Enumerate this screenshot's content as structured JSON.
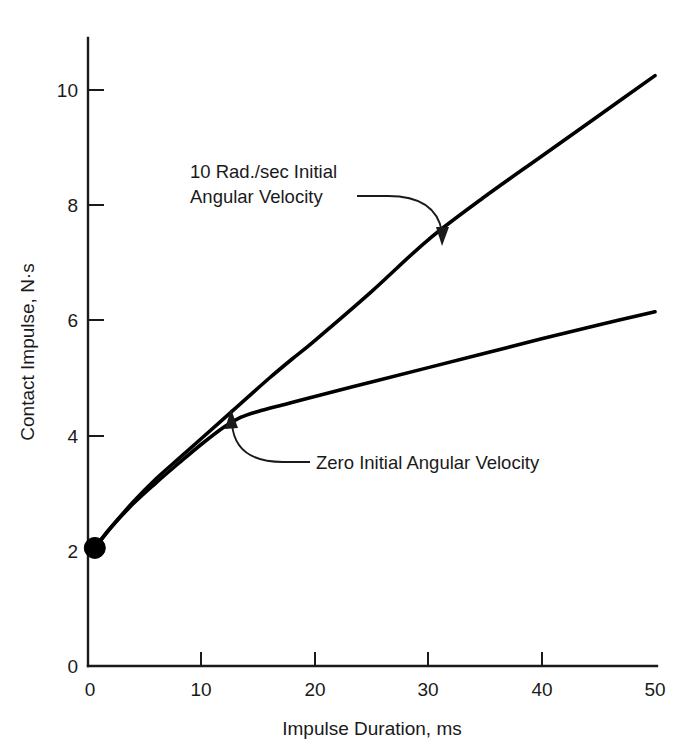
{
  "chart_data": {
    "type": "line",
    "title": "",
    "xlabel": "Impulse Duration, ms",
    "ylabel": "Contact Impulse, N·s",
    "xlim": [
      0,
      50
    ],
    "ylim": [
      0,
      10.6
    ],
    "xticks": [
      0,
      10,
      20,
      30,
      40,
      50
    ],
    "yticks": [
      0,
      2,
      4,
      6,
      8,
      10
    ],
    "xtick_labels": [
      "0",
      "10",
      "20",
      "30",
      "40",
      "50"
    ],
    "ytick_labels": [
      "0",
      "2",
      "4",
      "6",
      "8",
      "10"
    ],
    "grid": false,
    "legend_position": "none",
    "start_marker": {
      "x": 0.6,
      "y": 2.05,
      "style": "filled-circle"
    },
    "series": [
      {
        "name": "10 Rad./sec Initial Angular Velocity",
        "x": [
          0.6,
          2,
          4,
          6,
          8,
          10,
          12,
          14,
          16,
          18,
          20,
          25,
          30,
          35,
          40,
          45,
          50
        ],
        "y": [
          2.05,
          2.4,
          2.85,
          3.25,
          3.6,
          3.95,
          4.3,
          4.65,
          5.0,
          5.33,
          5.65,
          6.5,
          7.4,
          8.15,
          8.85,
          9.55,
          10.25
        ]
      },
      {
        "name": "Zero Initial Angular Velocity",
        "x": [
          0.6,
          2,
          4,
          6,
          8,
          10,
          12,
          13.5,
          15,
          17.5,
          20,
          25,
          30,
          35,
          40,
          45,
          50
        ],
        "y": [
          2.05,
          2.4,
          2.82,
          3.18,
          3.52,
          3.85,
          4.15,
          4.32,
          4.42,
          4.55,
          4.68,
          4.93,
          5.18,
          5.43,
          5.68,
          5.92,
          6.15
        ]
      }
    ],
    "annotations": [
      {
        "name": "upper-curve-annotation",
        "lines": [
          "10 Rad./sec Initial",
          "Angular Velocity"
        ],
        "text_x": 9.2,
        "text_y": 7.9,
        "points_to_x": 30.5,
        "points_to_y": 7.55
      },
      {
        "name": "lower-curve-annotation",
        "lines": [
          "Zero Initial Angular Velocity"
        ],
        "text_x": 18.5,
        "text_y": 3.6,
        "points_to_x": 13.6,
        "points_to_y": 4.38
      }
    ],
    "colors": {
      "curve": "#000000",
      "axis": "#1a1a1a",
      "background": "#ffffff",
      "text": "#1a1a1a"
    }
  }
}
